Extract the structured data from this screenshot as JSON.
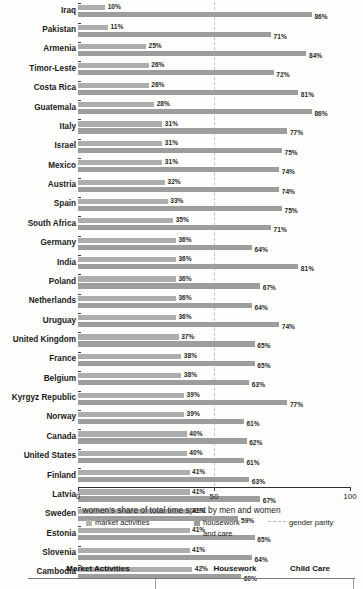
{
  "chart_data": {
    "type": "bar",
    "orientation": "horizontal",
    "title": "",
    "xlabel": "women's share of total time spent by men and women",
    "ylabel": "",
    "xlim": [
      0,
      100
    ],
    "xticks": [
      0,
      50,
      100
    ],
    "xtick_labels": [
      "0",
      "50",
      "100"
    ],
    "grid": false,
    "legend_position": "bottom",
    "categories": [
      "Iraq",
      "Pakistan",
      "Armenia",
      "Timor-Leste",
      "Costa Rica",
      "Guatemala",
      "Italy",
      "Israel",
      "Mexico",
      "Austria",
      "Spain",
      "South Africa",
      "Germany",
      "India",
      "Poland",
      "Netherlands",
      "Uruguay",
      "United Kingdom",
      "France",
      "Belgium",
      "Kyrgyz Republic",
      "Norway",
      "Canada",
      "United States",
      "Finland",
      "Latvia",
      "Sweden",
      "Estonia",
      "Slovenia",
      "Cambodia"
    ],
    "series": [
      {
        "name": "market activities",
        "color": "#adadad",
        "values": [
          10,
          11,
          25,
          26,
          26,
          28,
          31,
          31,
          31,
          32,
          33,
          35,
          36,
          36,
          36,
          36,
          36,
          37,
          38,
          38,
          39,
          39,
          40,
          40,
          41,
          41,
          41,
          41,
          41,
          42
        ],
        "labels": [
          "10%",
          "11%",
          "25%",
          "26%",
          "26%",
          "28%",
          "31%",
          "31%",
          "31%",
          "32%",
          "33%",
          "35%",
          "36%",
          "36%",
          "36%",
          "36%",
          "36%",
          "37%",
          "38%",
          "38%",
          "39%",
          "39%",
          "40%",
          "40%",
          "41%",
          "41%",
          "41%",
          "41%",
          "41%",
          "42%"
        ]
      },
      {
        "name": "housework and care",
        "color": "#9d9d9d",
        "values": [
          86,
          71,
          84,
          72,
          81,
          86,
          77,
          75,
          74,
          74,
          75,
          71,
          64,
          81,
          67,
          64,
          74,
          65,
          65,
          63,
          77,
          61,
          62,
          61,
          63,
          67,
          59,
          65,
          64,
          60
        ],
        "labels": [
          "86%",
          "71%",
          "84%",
          "72%",
          "81%",
          "86%",
          "77%",
          "75%",
          "74%",
          "74%",
          "75%",
          "71%",
          "64%",
          "81%",
          "67%",
          "64%",
          "74%",
          "65%",
          "65%",
          "63%",
          "77%",
          "61%",
          "62%",
          "61%",
          "63%",
          "67%",
          "59%",
          "65%",
          "64%",
          "60%"
        ]
      }
    ],
    "reference_line": {
      "name": "gender parity",
      "value": 50,
      "style": "dashed",
      "color": "#c2c2c2"
    }
  },
  "legend": {
    "market_label": "market activities",
    "housework_label": "housework",
    "housework_label_line2": "and care",
    "parity_label": "gender parity"
  },
  "axis": {
    "title": "women's share of total time spent by men and women",
    "tick_0": "0",
    "tick_50": "50",
    "tick_100": "100"
  },
  "table": {
    "headers": [
      "Market Activities",
      "Housework",
      "Child Care"
    ]
  }
}
